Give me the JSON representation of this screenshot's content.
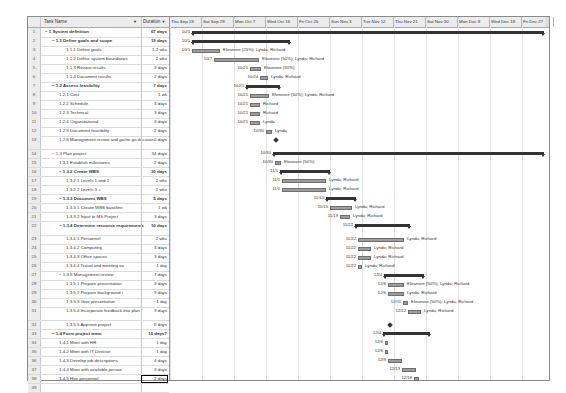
{
  "table": {
    "headers": {
      "task_name": "Task Name",
      "duration": "Duration"
    },
    "rows": [
      {
        "n": "1",
        "name": "− 1 System definition",
        "dur": "67 days",
        "lvl": 0,
        "bold": true
      },
      {
        "n": "2",
        "name": "− 1.1 Define goals and scope",
        "dur": "19 days",
        "lvl": 1,
        "bold": true
      },
      {
        "n": "3",
        "name": "1.1.1 Define goals",
        "dur": "1.2 wks",
        "lvl": 3
      },
      {
        "n": "4",
        "name": "1.1.2 Define system boundaries",
        "dur": "2 wks",
        "lvl": 3
      },
      {
        "n": "5",
        "name": "1.1.3 Review results",
        "dur": "3 days",
        "lvl": 3
      },
      {
        "n": "6",
        "name": "1.1.4 Document results",
        "dur": "2 days",
        "lvl": 3
      },
      {
        "n": "7",
        "name": "− 1.2 Assess feasibility",
        "dur": "7 days",
        "lvl": 1,
        "bold": true
      },
      {
        "n": "8",
        "name": "1.2.1 Cost",
        "dur": "1 wk",
        "lvl": 2
      },
      {
        "n": "9",
        "name": "1.2.2 Schedule",
        "dur": "3 days",
        "lvl": 2
      },
      {
        "n": "10",
        "name": "1.2.3 Technical",
        "dur": "3 days",
        "lvl": 2
      },
      {
        "n": "11",
        "name": "1.2.4 Organizational",
        "dur": "3 days",
        "lvl": 2
      },
      {
        "n": "12",
        "name": "1.2.5 Document feasibility",
        "dur": "2 days",
        "lvl": 2
      },
      {
        "n": "13",
        "name": "1.2.6 Management review and go/no go decision",
        "dur": "0 days",
        "lvl": 2,
        "tall": true
      },
      {
        "n": "14",
        "name": "− 1.3 Plan project",
        "dur": "34 days",
        "lvl": 1
      },
      {
        "n": "15",
        "name": "1.3.1 Establish milestones",
        "dur": "2 days",
        "lvl": 2
      },
      {
        "n": "16",
        "name": "− 1.3.2 Create WBS",
        "dur": "10 days",
        "lvl": 2,
        "bold": true
      },
      {
        "n": "17",
        "name": "1.3.2.1 Levels 1 and 2",
        "dur": "2 wks",
        "lvl": 3
      },
      {
        "n": "18",
        "name": "1.3.2.2 Levels 3 +",
        "dur": "2 wks",
        "lvl": 3
      },
      {
        "n": "19",
        "name": "− 1.3.3 Document WBS",
        "dur": "5 days",
        "lvl": 2,
        "bold": true
      },
      {
        "n": "20",
        "name": "1.3.3.1 Create WBS baseline",
        "dur": "1 wk",
        "lvl": 3
      },
      {
        "n": "21",
        "name": "1.3.3.2 Input to MS Project",
        "dur": "3 days",
        "lvl": 3
      },
      {
        "n": "22",
        "name": "− 1.3.4 Determine resource requirements",
        "dur": "10 days",
        "lvl": 2,
        "bold": true,
        "tall": true
      },
      {
        "n": "23",
        "name": "1.3.4.1 Personnel",
        "dur": "2 wks",
        "lvl": 3
      },
      {
        "n": "24",
        "name": "1.3.4.2 Computing",
        "dur": "3 days",
        "lvl": 3
      },
      {
        "n": "25",
        "name": "1.3.4.3 Office spaces",
        "dur": "3 days",
        "lvl": 3
      },
      {
        "n": "26",
        "name": "1.3.4.4 Travel and meeting ex",
        "dur": "1 day",
        "lvl": 3
      },
      {
        "n": "27",
        "name": "− 1.3.5 Management review",
        "dur": "7 days",
        "lvl": 2
      },
      {
        "n": "28",
        "name": "1.3.5.1 Prepare presentation",
        "dur": "3 days",
        "lvl": 3
      },
      {
        "n": "29",
        "name": "1.3.5.2 Prepare background i",
        "dur": "3 days",
        "lvl": 3
      },
      {
        "n": "30",
        "name": "1.3.5.3 Give presentation",
        "dur": "1 day",
        "lvl": 3
      },
      {
        "n": "31",
        "name": "1.3.5.4 Incorporate feedback into plan",
        "dur": "3 days",
        "lvl": 3,
        "tall": true
      },
      {
        "n": "32",
        "name": "1.3.5.5 Approve project",
        "dur": "0 days",
        "lvl": 3
      },
      {
        "n": "33",
        "name": "− 1.4 Form project team",
        "dur": "10 days?",
        "lvl": 1,
        "bold": true
      },
      {
        "n": "34",
        "name": "1.4.1 Meet with HR",
        "dur": "1 day",
        "lvl": 2
      },
      {
        "n": "35",
        "name": "1.4.2 Meet with IT Director",
        "dur": "1 day",
        "lvl": 2
      },
      {
        "n": "36",
        "name": "1.4.3 Develop job descriptions",
        "dur": "4 days",
        "lvl": 2
      },
      {
        "n": "37",
        "name": "1.4.4 Meet with available person",
        "dur": "3 days",
        "lvl": 2
      },
      {
        "n": "38",
        "name": "1.4.5 Hire personnel",
        "dur": "2 days",
        "lvl": 2,
        "selected": true
      },
      {
        "n": "39",
        "name": "",
        "dur": "",
        "lvl": 0
      }
    ]
  },
  "timeline": {
    "columns": [
      "Thu Sep 19",
      "Sat Sep 28",
      "Mon Oct 7",
      "Wed Oct 16",
      "Fri Oct 25",
      "Sun Nov 3",
      "Tue Nov 12",
      "Thu Nov 21",
      "Sat Nov 30",
      "Mon Dec 9",
      "Wed Dec 18",
      "Fri Dec 27"
    ],
    "items": [
      {
        "row": 0,
        "type": "sum",
        "x": 22,
        "w": 352,
        "date": "10/1",
        "label": ""
      },
      {
        "row": 1,
        "type": "sum",
        "x": 22,
        "w": 98,
        "date": "10/1",
        "label": ""
      },
      {
        "row": 2,
        "type": "bar",
        "x": 22,
        "w": 28,
        "date": "10/1",
        "label": "Eleanore (25%); Lynda; Richard"
      },
      {
        "row": 3,
        "type": "bar",
        "x": 44,
        "w": 45,
        "date": "10/7",
        "label": "Eleanore (50%); Lynda; Richard"
      },
      {
        "row": 4,
        "type": "bar",
        "x": 80,
        "w": 11,
        "date": "10/21",
        "label": "Eleanore (50%)"
      },
      {
        "row": 5,
        "type": "bar",
        "x": 90,
        "w": 8,
        "date": "10/24",
        "label": "Lynda; Richard"
      },
      {
        "row": 6,
        "type": "sum",
        "x": 76,
        "w": 34,
        "date": "10/21",
        "label": ""
      },
      {
        "row": 7,
        "type": "bar",
        "x": 80,
        "w": 19,
        "date": "10/21",
        "label": "Eleanore (50%); Lynda; Richard"
      },
      {
        "row": 8,
        "type": "bar",
        "x": 80,
        "w": 10,
        "date": "10/21",
        "label": "Richard"
      },
      {
        "row": 9,
        "type": "bar",
        "x": 80,
        "w": 10,
        "date": "10/21",
        "label": "Richard"
      },
      {
        "row": 10,
        "type": "bar",
        "x": 80,
        "w": 10,
        "date": "10/21",
        "label": "Lynda"
      },
      {
        "row": 11,
        "type": "bar",
        "x": 96,
        "w": 6,
        "date": "10/30",
        "label": "Lynda"
      },
      {
        "row": 12,
        "type": "ms",
        "x": 104,
        "date": "",
        "label": ""
      },
      {
        "row": 13,
        "type": "sum",
        "x": 103,
        "w": 271,
        "date": "10/30",
        "label": ""
      },
      {
        "row": 14,
        "type": "bar",
        "x": 105,
        "w": 6,
        "date": "10/30",
        "label": "Eleanore (50%)"
      },
      {
        "row": 15,
        "type": "sum",
        "x": 110,
        "w": 50,
        "date": "11/1",
        "label": ""
      },
      {
        "row": 16,
        "type": "bar",
        "x": 112,
        "w": 44,
        "date": "11/1",
        "label": "Lynda; Richard"
      },
      {
        "row": 17,
        "type": "bar",
        "x": 112,
        "w": 44,
        "date": "11/1",
        "label": "Lynda; Richard"
      },
      {
        "row": 18,
        "type": "sum",
        "x": 156,
        "w": 30,
        "date": "11/10",
        "label": ""
      },
      {
        "row": 19,
        "type": "bar",
        "x": 160,
        "w": 22,
        "date": "11/15",
        "label": "Lynda; Richard"
      },
      {
        "row": 20,
        "type": "bar",
        "x": 170,
        "w": 10,
        "date": "11/19",
        "label": "Lynda; Richard"
      },
      {
        "row": 21,
        "type": "sum",
        "x": 185,
        "w": 55,
        "date": "11/22",
        "label": ""
      },
      {
        "row": 22,
        "type": "bar",
        "x": 188,
        "w": 46,
        "date": "11/22",
        "label": "Lynda; Richard"
      },
      {
        "row": 23,
        "type": "bar",
        "x": 188,
        "w": 13,
        "date": "11/22",
        "label": "Lynda; Richard"
      },
      {
        "row": 24,
        "type": "bar",
        "x": 188,
        "w": 13,
        "date": "11/22",
        "label": "Lynda; Richard"
      },
      {
        "row": 25,
        "type": "bar",
        "x": 188,
        "w": 4,
        "date": "11/22",
        "label": "Lynda; Richard"
      },
      {
        "row": 26,
        "type": "sum",
        "x": 214,
        "w": 40,
        "date": "12/4",
        "label": ""
      },
      {
        "row": 27,
        "type": "bar",
        "x": 218,
        "w": 16,
        "date": "12/6",
        "label": "Eleanore (50%); Lynda; Richard"
      },
      {
        "row": 28,
        "type": "bar",
        "x": 218,
        "w": 16,
        "date": "12/6",
        "label": "Lynda; Richard"
      },
      {
        "row": 29,
        "type": "bar",
        "x": 233,
        "w": 5,
        "date": "12/11",
        "label": "Eleanore (50%); Lynda; Richard"
      },
      {
        "row": 30,
        "type": "bar",
        "x": 238,
        "w": 13,
        "date": "12/12",
        "label": "Lynda; Richard"
      },
      {
        "row": 31,
        "type": "ms",
        "x": 218,
        "date": "",
        "label": ""
      },
      {
        "row": 32,
        "type": "sum",
        "x": 213,
        "w": 47,
        "date": "12/4",
        "label": ""
      },
      {
        "row": 33,
        "type": "bar",
        "x": 215,
        "w": 3,
        "date": "12/6",
        "label": ""
      },
      {
        "row": 34,
        "type": "bar",
        "x": 215,
        "w": 3,
        "date": "12/6",
        "label": ""
      },
      {
        "row": 35,
        "type": "bar",
        "x": 218,
        "w": 14,
        "date": "12/9",
        "label": ""
      },
      {
        "row": 36,
        "type": "bar",
        "x": 232,
        "w": 14,
        "date": "12/13",
        "label": ""
      },
      {
        "row": 37,
        "type": "bar",
        "x": 244,
        "w": 5,
        "date": "12/18",
        "label": ""
      }
    ]
  }
}
